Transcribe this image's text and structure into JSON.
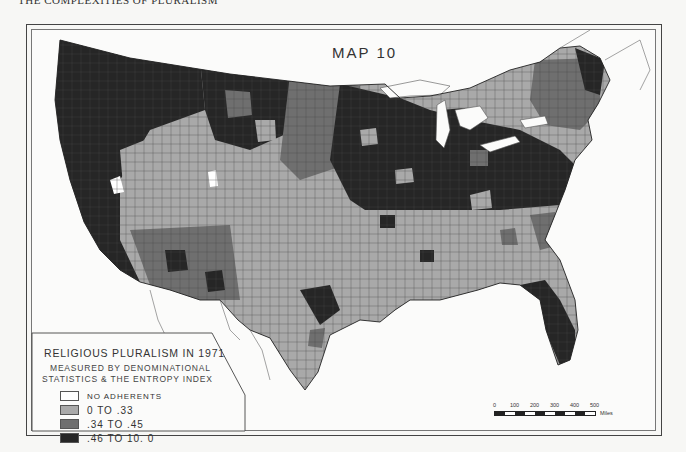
{
  "page": {
    "running_header": "THE COMPLEXITIES OF PLURALISM"
  },
  "map": {
    "title": "MAP 10",
    "subject": "Religious pluralism by county, contiguous United States, 1971",
    "colors": {
      "no_adherents": "#ffffff",
      "low": "#a9a9a9",
      "mid": "#6f6f6f",
      "high": "#262626",
      "water": "#fbfbfa",
      "outline": "#333333"
    },
    "regional_pattern": [
      {
        "region": "Pacific Northwest & California",
        "class": "high"
      },
      {
        "region": "Great Basin / Utah / Nevada interior",
        "class": "low"
      },
      {
        "region": "Arizona / New Mexico",
        "class": "mid"
      },
      {
        "region": "Northern Plains",
        "class": "mixed"
      },
      {
        "region": "Upper Midwest / Great Lakes (MN, WI, MI, IL, IN, OH)",
        "class": "high"
      },
      {
        "region": "Pennsylvania / New York",
        "class": "high"
      },
      {
        "region": "New England",
        "class": "low"
      },
      {
        "region": "Northern Maine",
        "class": "high"
      },
      {
        "region": "South (TX, LA, MS, AL, GA, TN, KY, Carolinas)",
        "class": "low"
      },
      {
        "region": "South Texas / Gulf coast patches",
        "class": "high"
      },
      {
        "region": "Florida peninsula",
        "class": "high"
      }
    ]
  },
  "legend": {
    "title": "RELIGIOUS PLURALISM IN 1971",
    "subtitle_line1": "MEASURED BY DENOMINATIONAL",
    "subtitle_line2": "STATISTICS & THE ENTROPY INDEX",
    "items": [
      {
        "label": "NO ADHERENTS",
        "color": "#ffffff"
      },
      {
        "label": "0 TO .33",
        "color": "#a9a9a9"
      },
      {
        "label": ".34 TO .45",
        "color": "#6f6f6f"
      },
      {
        "label": ".46 TO 10. 0",
        "color": "#262626"
      }
    ]
  },
  "scale": {
    "ticks": [
      "0",
      "100",
      "200",
      "300",
      "400",
      "500"
    ],
    "unit": "Miles"
  }
}
